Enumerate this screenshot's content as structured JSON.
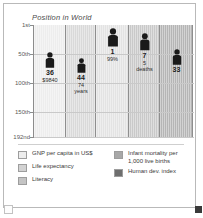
{
  "chart_data": {
    "type": "bar",
    "title": "Position in World",
    "xlabel": "",
    "ylabel": "Position in World",
    "axis_ticks": [
      {
        "label": "1st",
        "rank": 1
      },
      {
        "label": "50th",
        "rank": 50
      },
      {
        "label": "100th",
        "rank": 100
      },
      {
        "label": "150th",
        "rank": 150
      },
      {
        "label": "192nd",
        "rank": 192
      }
    ],
    "ylim": [
      1,
      192
    ],
    "grid": true,
    "legend_position": "bottom",
    "categories": [
      "GNP per capita in US$",
      "Life expectancy",
      "Literacy",
      "Infant mortality per 1,000 live births",
      "Human dev. index"
    ],
    "values": [
      36,
      44,
      1,
      7,
      33
    ],
    "series": [
      {
        "name": "Position in World",
        "values": [
          36,
          44,
          1,
          7,
          33
        ]
      }
    ],
    "annotations": [
      {
        "category": "GNP per capita in US$",
        "rank": 36,
        "detail": "$9840"
      },
      {
        "category": "Life expectancy",
        "rank": 44,
        "detail": "74 years"
      },
      {
        "category": "Literacy",
        "rank": 1,
        "detail": "99%"
      },
      {
        "category": "Infant mortality per 1,000 live births",
        "rank": 7,
        "detail": "5 deaths"
      },
      {
        "category": "Human dev. index",
        "rank": 33,
        "detail": ""
      }
    ]
  },
  "title": "Position in World",
  "axis": {
    "ticks": [
      {
        "label": "1st",
        "top": 0
      },
      {
        "label": "50th",
        "top": 29
      },
      {
        "label": "100th",
        "top": 58
      },
      {
        "label": "150th",
        "top": 87
      },
      {
        "label": "192nd",
        "top": 112
      }
    ]
  },
  "columns": [
    {
      "name": "gnp-per-capita",
      "left": 0,
      "width": 32,
      "fill": "#ededed",
      "rank_label": "36",
      "detail_line1": "$9840",
      "detail_line2": "",
      "marker_top": 27,
      "icon_scale": 0.86
    },
    {
      "name": "life-expectancy",
      "left": 32,
      "width": 30,
      "fill": "#d9d9d9",
      "rank_label": "44",
      "detail_line1": "74",
      "detail_line2": "years",
      "marker_top": 33,
      "icon_scale": 0.8
    },
    {
      "name": "literacy",
      "left": 62,
      "width": 33,
      "fill": "#e3e3e3",
      "rank_label": "1",
      "detail_line1": "99%",
      "detail_line2": "",
      "marker_top": 3,
      "icon_scale": 1.0
    },
    {
      "name": "infant-mortality",
      "left": 95,
      "width": 31,
      "fill": "#c9c9c9",
      "rank_label": "7",
      "detail_line1": "5",
      "detail_line2": "deaths",
      "marker_top": 8,
      "icon_scale": 0.94
    },
    {
      "name": "human-dev-index",
      "left": 126,
      "width": 33,
      "fill": "#b5b5b5",
      "rank_label": "33",
      "detail_line1": "",
      "detail_line2": "",
      "marker_top": 24,
      "icon_scale": 0.86
    }
  ],
  "legend": {
    "left_items": [
      {
        "label": "GNP per capita in US$",
        "color": "#ededed"
      },
      {
        "label": "Life expectancy",
        "color": "#d2d2d2"
      },
      {
        "label": "Literacy",
        "color": "#c4c4c4"
      }
    ],
    "right_items": [
      {
        "label": "Infant mortality per",
        "label2": "1,000 live births",
        "color": "#a8a8a8"
      },
      {
        "label": "Human dev. index",
        "label2": "",
        "color": "#6e6e6e"
      }
    ]
  },
  "colors": {
    "frame": "#b9b9b9",
    "axis": "#8c8c8c",
    "grid": "#c9c9c9",
    "marker": "#1a1a1a",
    "text": "#3a3a3a"
  }
}
